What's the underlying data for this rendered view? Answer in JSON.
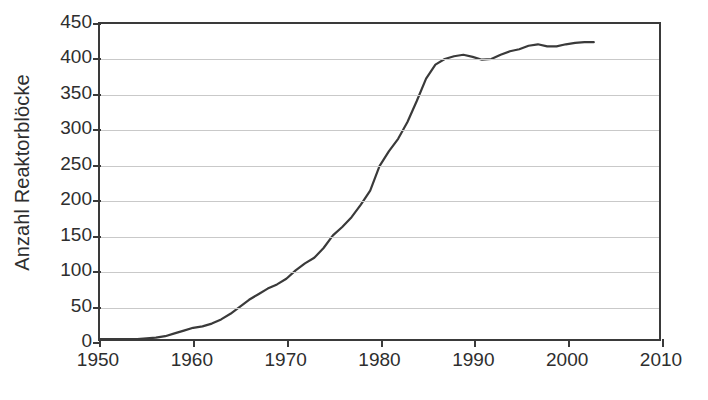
{
  "chart_data": {
    "type": "line",
    "title": "",
    "xlabel": "",
    "ylabel": "Anzahl Reaktorblöcke",
    "xlim": [
      1950,
      2010
    ],
    "ylim": [
      0,
      450
    ],
    "grid": true,
    "legend": false,
    "line_color": "#3a3a3a",
    "grid_color": "#c9c9c9",
    "axis_color": "#3a3a3a",
    "background_color": "#ffffff",
    "xticks": [
      1950,
      1960,
      1970,
      1980,
      1990,
      2000,
      2010
    ],
    "yticks": [
      0,
      50,
      100,
      150,
      200,
      250,
      300,
      350,
      400,
      450
    ],
    "series": [
      {
        "name": "Anzahl Reaktorblöcke",
        "x": [
          1950,
          1951,
          1952,
          1953,
          1954,
          1955,
          1956,
          1957,
          1958,
          1959,
          1960,
          1961,
          1962,
          1963,
          1964,
          1965,
          1966,
          1967,
          1968,
          1969,
          1970,
          1971,
          1972,
          1973,
          1974,
          1975,
          1976,
          1977,
          1978,
          1979,
          1980,
          1981,
          1982,
          1983,
          1984,
          1985,
          1986,
          1987,
          1988,
          1989,
          1990,
          1991,
          1992,
          1993,
          1994,
          1995,
          1996,
          1997,
          1998,
          1999,
          2000,
          2001,
          2002,
          2003
        ],
        "values": [
          0,
          0,
          0,
          0,
          0,
          1,
          2,
          4,
          8,
          12,
          16,
          18,
          22,
          28,
          36,
          46,
          56,
          64,
          72,
          78,
          86,
          98,
          108,
          116,
          130,
          148,
          160,
          174,
          192,
          212,
          247,
          268,
          286,
          310,
          340,
          372,
          392,
          400,
          404,
          406,
          403,
          399,
          400,
          406,
          411,
          414,
          419,
          421,
          418,
          418,
          421,
          423,
          424,
          424
        ],
        "end_year": 2003,
        "peak_value": 424,
        "notes": "Number of nuclear reactor units worldwide; flat near zero until mid-1950s, steep growth 1965-1987, plateau above 400 after 1988"
      }
    ]
  }
}
